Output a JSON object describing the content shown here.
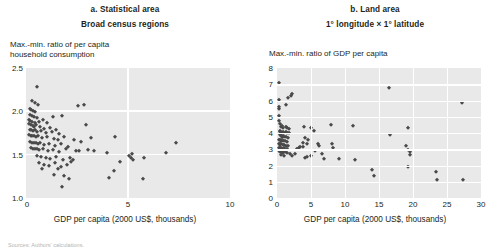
{
  "figure": {
    "source_note": "Sources: Authors' calculations."
  },
  "chart_data": [
    {
      "id": "panel-a",
      "type": "scatter",
      "title": "a. Statistical area",
      "subtitle": "Broad census regions",
      "ylabel": "Max.-min. ratio of per capita\nhousehold consumption",
      "xlabel": "GDP per capita (2000 US$, thousands)",
      "xlim": [
        0,
        10
      ],
      "ylim": [
        1.0,
        2.5
      ],
      "xticks": [
        0,
        5,
        10
      ],
      "xticklabels": [
        "0",
        "5",
        "10"
      ],
      "yticks": [
        1.0,
        1.5,
        2.0,
        2.5
      ],
      "yticklabels": [
        "1.0",
        "1.5",
        "2.0",
        "2.5"
      ],
      "grid": true,
      "legend": "none",
      "marker": "diamond",
      "marker_color": "#4a4a4a",
      "plot_background": "#e9e9e9",
      "points": [
        [
          0.55,
          2.28
        ],
        [
          0.3,
          2.12
        ],
        [
          0.42,
          2.1
        ],
        [
          0.58,
          2.07
        ],
        [
          0.2,
          2.03
        ],
        [
          0.25,
          2.01
        ],
        [
          0.34,
          2.0
        ],
        [
          0.46,
          1.99
        ],
        [
          2.55,
          2.06
        ],
        [
          2.85,
          2.07
        ],
        [
          0.18,
          1.96
        ],
        [
          0.28,
          1.95
        ],
        [
          0.38,
          1.93
        ],
        [
          0.52,
          1.92
        ],
        [
          1.3,
          1.93
        ],
        [
          1.75,
          1.95
        ],
        [
          0.15,
          1.9
        ],
        [
          0.22,
          1.89
        ],
        [
          0.31,
          1.88
        ],
        [
          0.44,
          1.87
        ],
        [
          0.62,
          1.88
        ],
        [
          0.82,
          1.9
        ],
        [
          1.05,
          1.86
        ],
        [
          0.17,
          1.85
        ],
        [
          0.24,
          1.84
        ],
        [
          0.33,
          1.83
        ],
        [
          0.4,
          1.82
        ],
        [
          0.5,
          1.84
        ],
        [
          0.68,
          1.82
        ],
        [
          0.9,
          1.8
        ],
        [
          1.18,
          1.81
        ],
        [
          2.95,
          1.84
        ],
        [
          0.19,
          1.79
        ],
        [
          0.26,
          1.78
        ],
        [
          0.35,
          1.77
        ],
        [
          0.45,
          1.78
        ],
        [
          0.55,
          1.76
        ],
        [
          0.72,
          1.77
        ],
        [
          0.96,
          1.75
        ],
        [
          1.25,
          1.76
        ],
        [
          1.45,
          1.78
        ],
        [
          1.6,
          1.74
        ],
        [
          0.16,
          1.73
        ],
        [
          0.23,
          1.72
        ],
        [
          0.3,
          1.71
        ],
        [
          0.39,
          1.72
        ],
        [
          0.48,
          1.7
        ],
        [
          0.6,
          1.71
        ],
        [
          0.78,
          1.69
        ],
        [
          1.02,
          1.7
        ],
        [
          1.35,
          1.68
        ],
        [
          1.55,
          1.67
        ],
        [
          1.88,
          1.7
        ],
        [
          2.35,
          1.67
        ],
        [
          2.7,
          1.65
        ],
        [
          3.2,
          1.69
        ],
        [
          4.35,
          1.7
        ],
        [
          0.21,
          1.65
        ],
        [
          0.29,
          1.64
        ],
        [
          0.37,
          1.63
        ],
        [
          0.47,
          1.64
        ],
        [
          0.58,
          1.62
        ],
        [
          0.7,
          1.63
        ],
        [
          0.88,
          1.61
        ],
        [
          1.12,
          1.62
        ],
        [
          1.4,
          1.6
        ],
        [
          1.7,
          1.62
        ],
        [
          2.05,
          1.59
        ],
        [
          0.24,
          1.58
        ],
        [
          0.32,
          1.57
        ],
        [
          0.42,
          1.56
        ],
        [
          0.54,
          1.57
        ],
        [
          0.66,
          1.55
        ],
        [
          0.85,
          1.56
        ],
        [
          1.08,
          1.54
        ],
        [
          1.3,
          1.55
        ],
        [
          1.62,
          1.53
        ],
        [
          1.95,
          1.56
        ],
        [
          2.45,
          1.54
        ],
        [
          2.62,
          1.54
        ],
        [
          3.05,
          1.55
        ],
        [
          3.35,
          1.54
        ],
        [
          3.95,
          1.52
        ],
        [
          5.2,
          1.51
        ],
        [
          7.35,
          1.64
        ],
        [
          6.85,
          1.52
        ],
        [
          0.52,
          1.48
        ],
        [
          0.75,
          1.47
        ],
        [
          0.98,
          1.46
        ],
        [
          1.2,
          1.45
        ],
        [
          1.48,
          1.47
        ],
        [
          1.8,
          1.44
        ],
        [
          2.15,
          1.46
        ],
        [
          2.3,
          1.44
        ],
        [
          5.05,
          1.48
        ],
        [
          5.15,
          1.46
        ],
        [
          5.25,
          1.44
        ],
        [
          5.8,
          1.46
        ],
        [
          0.62,
          1.4
        ],
        [
          0.9,
          1.38
        ],
        [
          1.15,
          1.37
        ],
        [
          1.42,
          1.4
        ],
        [
          1.7,
          1.36
        ],
        [
          2.0,
          1.38
        ],
        [
          2.2,
          1.42
        ],
        [
          4.6,
          1.42
        ],
        [
          0.8,
          1.34
        ],
        [
          1.55,
          1.33
        ],
        [
          4.3,
          1.31
        ],
        [
          1.35,
          1.27
        ],
        [
          1.85,
          1.25
        ],
        [
          2.1,
          1.22
        ],
        [
          4.05,
          1.23
        ],
        [
          5.75,
          1.22
        ],
        [
          1.75,
          1.13
        ]
      ]
    },
    {
      "id": "panel-b",
      "type": "scatter",
      "title": "b. Land area",
      "subtitle": "1° longitude × 1° latitude",
      "ylabel": "Max.-min. ratio of GDP per capita",
      "xlabel": "GDP per capita (2000 US$, thousands)",
      "xlim": [
        0,
        30
      ],
      "ylim": [
        0,
        8
      ],
      "xticks": [
        0,
        5,
        10,
        15,
        20,
        25,
        30
      ],
      "xticklabels": [
        "0",
        "5",
        "10",
        "15",
        "20",
        "25",
        "30"
      ],
      "yticks": [
        0,
        1,
        2,
        3,
        4,
        5,
        6,
        7,
        8
      ],
      "yticklabels": [
        "0",
        "1",
        "2",
        "3",
        "4",
        "5",
        "6",
        "7",
        "8"
      ],
      "grid": true,
      "legend": "none",
      "marker": "diamond",
      "marker_color": "#4a4a4a",
      "plot_background": "#e9e9e9",
      "points": [
        [
          0.3,
          7.05
        ],
        [
          16.5,
          6.8
        ],
        [
          0.25,
          6.02
        ],
        [
          1.55,
          6.18
        ],
        [
          2.05,
          6.3
        ],
        [
          2.15,
          6.38
        ],
        [
          27.2,
          5.82
        ],
        [
          0.3,
          5.62
        ],
        [
          0.32,
          5.5
        ],
        [
          1.25,
          5.7
        ],
        [
          0.28,
          5.05
        ],
        [
          0.35,
          4.72
        ],
        [
          0.42,
          4.58
        ],
        [
          0.55,
          4.38
        ],
        [
          0.75,
          4.42
        ],
        [
          0.95,
          4.3
        ],
        [
          1.25,
          4.35
        ],
        [
          1.45,
          4.28
        ],
        [
          1.7,
          4.22
        ],
        [
          3.95,
          4.4
        ],
        [
          5.05,
          4.3
        ],
        [
          5.45,
          4.15
        ],
        [
          7.95,
          4.48
        ],
        [
          11.2,
          4.45
        ],
        [
          19.3,
          4.32
        ],
        [
          0.38,
          4.1
        ],
        [
          0.48,
          4.05
        ],
        [
          0.62,
          4.02
        ],
        [
          0.82,
          4.08
        ],
        [
          1.05,
          4.0
        ],
        [
          1.3,
          4.05
        ],
        [
          1.52,
          3.98
        ],
        [
          1.78,
          4.02
        ],
        [
          16.6,
          3.88
        ],
        [
          0.42,
          3.85
        ],
        [
          0.55,
          3.8
        ],
        [
          0.7,
          3.78
        ],
        [
          0.88,
          3.82
        ],
        [
          1.1,
          3.75
        ],
        [
          1.38,
          3.78
        ],
        [
          1.62,
          3.7
        ],
        [
          4.15,
          3.68
        ],
        [
          4.55,
          3.55
        ],
        [
          0.35,
          3.6
        ],
        [
          0.45,
          3.55
        ],
        [
          0.58,
          3.52
        ],
        [
          0.72,
          3.56
        ],
        [
          0.92,
          3.48
        ],
        [
          1.15,
          3.52
        ],
        [
          1.42,
          3.45
        ],
        [
          3.85,
          3.4
        ],
        [
          4.35,
          3.3
        ],
        [
          6.05,
          3.35
        ],
        [
          6.15,
          3.18
        ],
        [
          0.3,
          3.35
        ],
        [
          0.4,
          3.3
        ],
        [
          0.5,
          3.28
        ],
        [
          0.65,
          3.32
        ],
        [
          0.85,
          3.25
        ],
        [
          1.08,
          3.28
        ],
        [
          1.35,
          3.22
        ],
        [
          1.58,
          3.18
        ],
        [
          3.45,
          3.15
        ],
        [
          3.75,
          3.12
        ],
        [
          8.15,
          3.3
        ],
        [
          8.25,
          3.05
        ],
        [
          19.0,
          3.18
        ],
        [
          19.3,
          2.98
        ],
        [
          19.5,
          2.82
        ],
        [
          0.28,
          3.1
        ],
        [
          0.38,
          3.05
        ],
        [
          0.48,
          3.02
        ],
        [
          0.6,
          3.08
        ],
        [
          0.78,
          3.0
        ],
        [
          0.98,
          3.05
        ],
        [
          1.22,
          2.98
        ],
        [
          1.48,
          3.02
        ],
        [
          2.95,
          3.02
        ],
        [
          3.25,
          3.05
        ],
        [
          5.55,
          2.92
        ],
        [
          0.32,
          2.88
        ],
        [
          0.44,
          2.85
        ],
        [
          0.56,
          2.82
        ],
        [
          0.7,
          2.86
        ],
        [
          0.9,
          2.8
        ],
        [
          1.15,
          2.84
        ],
        [
          1.45,
          2.76
        ],
        [
          1.85,
          2.72
        ],
        [
          2.65,
          2.72
        ],
        [
          6.55,
          2.68
        ],
        [
          19.6,
          2.62
        ],
        [
          0.55,
          2.62
        ],
        [
          1.05,
          2.58
        ],
        [
          2.25,
          2.58
        ],
        [
          4.15,
          2.48
        ],
        [
          4.45,
          2.52
        ],
        [
          5.05,
          2.58
        ],
        [
          6.85,
          2.42
        ],
        [
          9.05,
          2.38
        ],
        [
          11.4,
          2.35
        ],
        [
          19.2,
          1.88
        ],
        [
          13.9,
          1.72
        ],
        [
          23.4,
          1.62
        ],
        [
          14.2,
          1.35
        ],
        [
          23.6,
          1.08
        ],
        [
          27.3,
          1.08
        ]
      ]
    }
  ]
}
